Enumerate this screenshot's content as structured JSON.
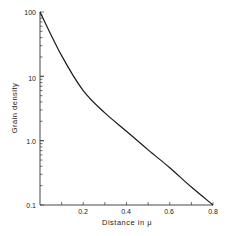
{
  "chart_data": {
    "type": "line",
    "title": "",
    "xlabel": "Distance in μ",
    "ylabel": "Grain density",
    "xscale": "linear",
    "yscale": "log",
    "xlim": [
      0,
      0.8
    ],
    "ylim": [
      0.1,
      100
    ],
    "grid": false,
    "legend": null,
    "x_ticks": [
      0.2,
      0.4,
      0.6,
      0.8
    ],
    "x_tick_labels": [
      "0.2",
      "0.4",
      "0.6",
      "0.8"
    ],
    "x_minor_ticks": [
      0.1,
      0.3,
      0.5,
      0.7
    ],
    "y_ticks": [
      0.1,
      1.0,
      10,
      100
    ],
    "y_tick_labels": [
      "0.1",
      "1.0",
      "10",
      "100"
    ],
    "series": [
      {
        "name": "Grain density",
        "x": [
          0,
          0.1,
          0.2,
          0.3,
          0.4,
          0.5,
          0.6,
          0.7,
          0.8
        ],
        "y": [
          100,
          21,
          6,
          2.7,
          1.4,
          0.72,
          0.38,
          0.19,
          0.1
        ]
      }
    ]
  },
  "labels": {
    "xlabel": "Distance in μ",
    "ylabel": "Grain density",
    "x_ticks": [
      "0.2",
      "0.4",
      "0.6",
      "0.8"
    ],
    "y_ticks": [
      "100",
      "10",
      "1.0",
      "0.1"
    ]
  }
}
